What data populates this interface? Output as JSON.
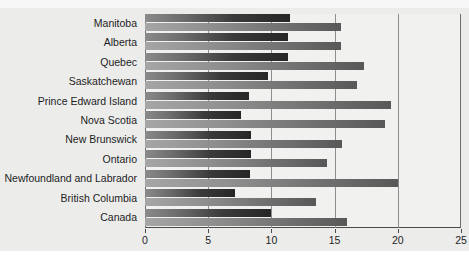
{
  "chart_data": {
    "type": "bar",
    "orientation": "horizontal",
    "title": "",
    "subtitle": "",
    "xlabel": "",
    "ylabel": "",
    "xlim": [
      0,
      25
    ],
    "xticks": [
      0,
      5,
      10,
      15,
      20,
      25
    ],
    "xtick_labels": [
      "0",
      "5",
      "10",
      "15",
      "20",
      "25"
    ],
    "grid": true,
    "grid_axis": "x",
    "legend": false,
    "legend_position": "none",
    "categories": [
      "Manitoba",
      "Alberta",
      "Quebec",
      "Saskatchewan",
      "Prince Edward Island",
      "Nova Scotia",
      "New Brunswick",
      "Ontario",
      "Newfoundland and Labrador",
      "British Columbia",
      "Canada"
    ],
    "series": [
      {
        "name": "series-1",
        "color": "#3a3a3a",
        "values": [
          11.5,
          11.3,
          11.3,
          9.7,
          8.2,
          7.6,
          8.4,
          8.4,
          8.3,
          7.1,
          10.0
        ]
      },
      {
        "name": "series-2",
        "color": "#7a7a7a",
        "values": [
          15.5,
          15.5,
          17.3,
          16.8,
          19.5,
          19.0,
          15.6,
          14.4,
          20.0,
          13.5,
          16.0
        ]
      }
    ]
  },
  "colors": {
    "background": "#ececeb",
    "plot_background": "#f1f1f0",
    "axis": "#4a4a4a",
    "gridline": "#8d8d8d",
    "text": "#1d1d1d"
  }
}
